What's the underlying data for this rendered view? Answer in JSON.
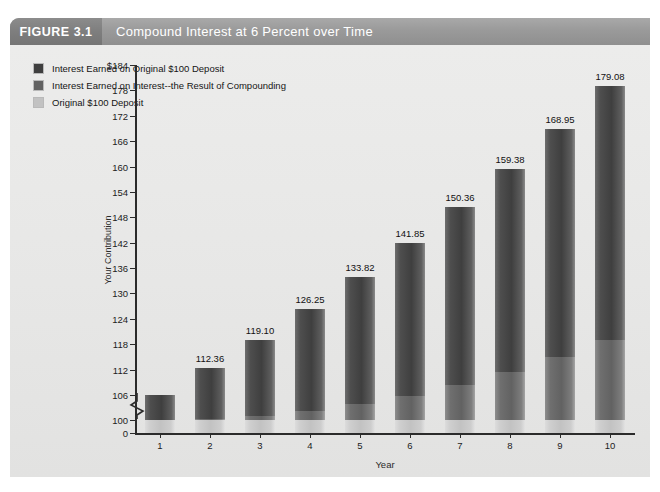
{
  "header": {
    "tag": "FIGURE 3.1",
    "title": "Compound Interest at 6 Percent over Time"
  },
  "legend": {
    "position": "top-left",
    "items": [
      {
        "label": "Interest Earned on Original $100 Deposit",
        "color": "#3f3f3f",
        "key": "interest_on_principal"
      },
      {
        "label": "Interest Earned on Interest--the Result of Compounding",
        "color": "#626262",
        "key": "interest_on_interest"
      },
      {
        "label": "Original $100 Deposit",
        "color": "#c2c2c2",
        "key": "principal"
      }
    ]
  },
  "chart_data": {
    "type": "bar",
    "title": "Compound Interest at 6 Percent over Time",
    "subtitle": "FIGURE 3.1",
    "stacked": true,
    "xlabel": "Year",
    "ylabel": "Your Contribution",
    "categories": [
      "1",
      "2",
      "3",
      "4",
      "5",
      "6",
      "7",
      "8",
      "9",
      "10"
    ],
    "values": [
      106.0,
      112.36,
      119.1,
      126.25,
      133.82,
      141.85,
      150.36,
      159.38,
      168.95,
      179.08
    ],
    "value_labels": [
      "106.00",
      "112.36",
      "119.10",
      "126.25",
      "133.82",
      "141.85",
      "150.36",
      "159.38",
      "168.95",
      "179.08"
    ],
    "series": [
      {
        "name": "Original $100 Deposit",
        "color": "#c2c2c2",
        "values": [
          100.0,
          100.0,
          100.0,
          100.0,
          100.0,
          100.0,
          100.0,
          100.0,
          100.0,
          100.0
        ]
      },
      {
        "name": "Interest Earned on Interest--the Result of Compounding",
        "color": "#626262",
        "values": [
          0.0,
          0.36,
          1.1,
          2.25,
          3.82,
          5.85,
          8.36,
          11.38,
          14.95,
          19.08
        ]
      },
      {
        "name": "Interest Earned on Original $100 Deposit",
        "color": "#3f3f3f",
        "values": [
          6.0,
          12.0,
          18.0,
          24.0,
          30.0,
          36.0,
          42.0,
          48.0,
          54.0,
          60.0
        ]
      }
    ],
    "ylim": [
      0,
      184
    ],
    "y_axis_break": true,
    "y_axis_break_after": 0,
    "y_plot_min": 97,
    "yticks": [
      0,
      100,
      106,
      112,
      118,
      124,
      130,
      136,
      142,
      148,
      154,
      160,
      166,
      172,
      178,
      184
    ],
    "ytick_labels": [
      "0",
      "100",
      "106",
      "112",
      "118",
      "124",
      "130",
      "136",
      "142",
      "148",
      "154",
      "160",
      "166",
      "172",
      "178",
      "$184"
    ],
    "grid": false,
    "legend_position": "top-left"
  },
  "colors": {
    "header_tag": "#7e7e7e",
    "header_bar": "#9a9a9a",
    "panel": "#e8e8e7",
    "axis": "#2b2b2b",
    "text": "#1c1c1c"
  }
}
